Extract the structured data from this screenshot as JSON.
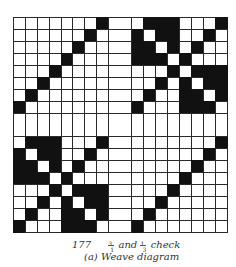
{
  "diagram": {
    "type": "weave-diagram",
    "layout": "2x2 blocks of 8x8 cells separated by a blank double-width column and row",
    "colors": {
      "raised": "#111111",
      "lowered": "#ffffff",
      "grid_line": "#2a2a2a"
    },
    "blocks": {
      "top_left": [
        [
          0,
          0,
          0,
          0,
          0,
          0,
          0,
          1
        ],
        [
          0,
          0,
          0,
          0,
          0,
          0,
          1,
          0
        ],
        [
          0,
          0,
          0,
          0,
          0,
          1,
          0,
          0
        ],
        [
          0,
          0,
          0,
          0,
          1,
          0,
          0,
          0
        ],
        [
          0,
          0,
          0,
          1,
          0,
          0,
          0,
          0
        ],
        [
          0,
          0,
          1,
          0,
          0,
          0,
          0,
          0
        ],
        [
          0,
          1,
          0,
          0,
          0,
          0,
          0,
          0
        ],
        [
          1,
          0,
          0,
          0,
          0,
          0,
          0,
          0
        ]
      ],
      "top_right": [
        [
          0,
          1,
          1,
          1,
          0,
          0,
          0,
          1
        ],
        [
          1,
          0,
          1,
          1,
          0,
          0,
          1,
          0
        ],
        [
          1,
          1,
          0,
          1,
          0,
          1,
          0,
          0
        ],
        [
          1,
          1,
          1,
          0,
          1,
          0,
          0,
          0
        ],
        [
          0,
          0,
          0,
          1,
          0,
          1,
          1,
          1
        ],
        [
          0,
          0,
          1,
          0,
          1,
          0,
          1,
          1
        ],
        [
          0,
          1,
          0,
          0,
          1,
          1,
          0,
          1
        ],
        [
          1,
          0,
          0,
          0,
          1,
          1,
          1,
          0
        ]
      ],
      "bottom_left": [
        [
          0,
          1,
          1,
          1,
          0,
          0,
          0,
          1
        ],
        [
          1,
          0,
          1,
          1,
          0,
          0,
          1,
          0
        ],
        [
          1,
          1,
          0,
          1,
          0,
          1,
          0,
          0
        ],
        [
          1,
          1,
          1,
          0,
          1,
          0,
          0,
          0
        ],
        [
          0,
          0,
          0,
          1,
          0,
          1,
          1,
          1
        ],
        [
          0,
          0,
          1,
          0,
          1,
          0,
          1,
          1
        ],
        [
          0,
          1,
          0,
          0,
          1,
          1,
          0,
          1
        ],
        [
          1,
          0,
          0,
          0,
          1,
          1,
          1,
          0
        ]
      ],
      "bottom_right": [
        [
          0,
          0,
          0,
          0,
          0,
          0,
          0,
          1
        ],
        [
          0,
          0,
          0,
          0,
          0,
          0,
          1,
          0
        ],
        [
          0,
          0,
          0,
          0,
          0,
          1,
          0,
          0
        ],
        [
          0,
          0,
          0,
          0,
          1,
          0,
          0,
          0
        ],
        [
          0,
          0,
          0,
          1,
          0,
          0,
          0,
          0
        ],
        [
          0,
          0,
          1,
          0,
          0,
          0,
          0,
          0
        ],
        [
          0,
          1,
          0,
          0,
          0,
          0,
          0,
          0
        ],
        [
          1,
          0,
          0,
          0,
          0,
          0,
          0,
          0
        ]
      ]
    }
  },
  "caption": {
    "figure_number": "177",
    "frac1": {
      "num": "3",
      "den": "1"
    },
    "connector": "and",
    "frac2": {
      "num": "1",
      "den": "3"
    },
    "title_suffix": "check",
    "subtitle": "(a)  Weave diagram"
  }
}
